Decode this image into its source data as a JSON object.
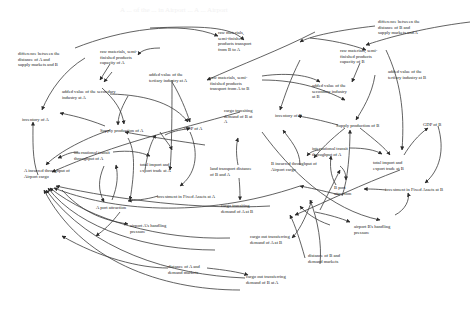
{
  "diagram": {
    "faint_header": "A ... of the ... in Airport ... A ... Airport",
    "nodes": {
      "diff_A": {
        "label": "difference between the\ndistance of A and\nsupply markets and B",
        "x": 18,
        "y": 51
      },
      "raw_cap_A": {
        "label": "raw materials, semi-\nfinished products\ncapacity of A",
        "x": 100,
        "y": 49
      },
      "raw_trans_BA": {
        "label": "raw materials,\nsemi-finished\nproducts transport\nfrom B to A",
        "x": 218,
        "y": 30
      },
      "diff_B": {
        "label": "difference between the\ndistance of B and\nsupply markets and A",
        "x": 378,
        "y": 19
      },
      "raw_cap_B": {
        "label": "raw materials, semi-\nfinished products\ncapacity of B",
        "x": 340,
        "y": 48
      },
      "sec_ind_A": {
        "label": "added value of the secondary\nindustry at A",
        "x": 62,
        "y": 89
      },
      "ter_ind_A": {
        "label": "added value of the\ntertiary industry at A",
        "x": 149,
        "y": 72
      },
      "raw_trans_AB": {
        "label": "raw materials, semi-\nfinished products\ntransport from A to B",
        "x": 210,
        "y": 75
      },
      "sec_ind_B": {
        "label": "added value of the\nsecondary industry\nat B",
        "x": 312,
        "y": 83
      },
      "ter_ind_B": {
        "label": "added value of the\ntertiary industry at B",
        "x": 388,
        "y": 69
      },
      "inventory_A": {
        "label": "inventory of A",
        "x": 22,
        "y": 117
      },
      "supply_A": {
        "label": "Supply production of A",
        "x": 100,
        "y": 128
      },
      "gdp_A": {
        "label": "GDP of A",
        "x": 184,
        "y": 126
      },
      "cargo_trans_BA": {
        "label": "cargo transiting\ndemand of B at\nA",
        "x": 224,
        "y": 108
      },
      "inventory_B": {
        "label": "inventory of B",
        "x": 275,
        "y": 113
      },
      "supply_B": {
        "label": "Supply production of B",
        "x": 336,
        "y": 123
      },
      "gdp_B": {
        "label": "GDP of B",
        "x": 423,
        "y": 122
      },
      "intl_transit_A": {
        "label": "international transit\nthroughput of A",
        "x": 74,
        "y": 150
      },
      "total_trade_A": {
        "label": "total import and\nexport trade at A",
        "x": 140,
        "y": 162
      },
      "land_dist_AB": {
        "label": "land transport distance\nof B and A",
        "x": 210,
        "y": 166
      },
      "B_inc_throughput": {
        "label": "B incurred throughput of\nAirport cargo",
        "x": 271,
        "y": 161
      },
      "intl_transit_B": {
        "label": "international transit\nthroughput of A",
        "x": 312,
        "y": 146
      },
      "total_trade_B": {
        "label": "total import and\nexport trade at B",
        "x": 373,
        "y": 160
      },
      "A_inc_throughput": {
        "label": "A incurred throughput of\nAirport cargo",
        "x": 24,
        "y": 168
      },
      "inv_fixed_A": {
        "label": "investment in Fixed Assets  at A",
        "x": 157,
        "y": 194
      },
      "inv_fixed_B": {
        "label": "investment in Fixed Assets  at B",
        "x": 385,
        "y": 187
      },
      "B_port_attr": {
        "label": "B port\nattraction",
        "x": 334,
        "y": 185
      },
      "A_port_attr": {
        "label": "A port attraction",
        "x": 96,
        "y": 205
      },
      "cargo_trans_AB": {
        "label": "cargo transiting\ndemand of A at B",
        "x": 221,
        "y": 203
      },
      "handling_A": {
        "label": "airport A's handling\npressure",
        "x": 130,
        "y": 223
      },
      "handling_B": {
        "label": "airport B's handling\npressure",
        "x": 354,
        "y": 224
      },
      "cargo_out_AB": {
        "label": "cargo out transferring\ndemand of A at B",
        "x": 250,
        "y": 234
      },
      "dist_B_demand": {
        "label": "distance of  B and\ndemand markets",
        "x": 308,
        "y": 253
      },
      "dist_A_demand": {
        "label": "distance of  A and\ndemand markets",
        "x": 168,
        "y": 264
      },
      "cargo_out_BA": {
        "label": "cargo out transferring\ndemand of B at A",
        "x": 246,
        "y": 274
      }
    }
  }
}
